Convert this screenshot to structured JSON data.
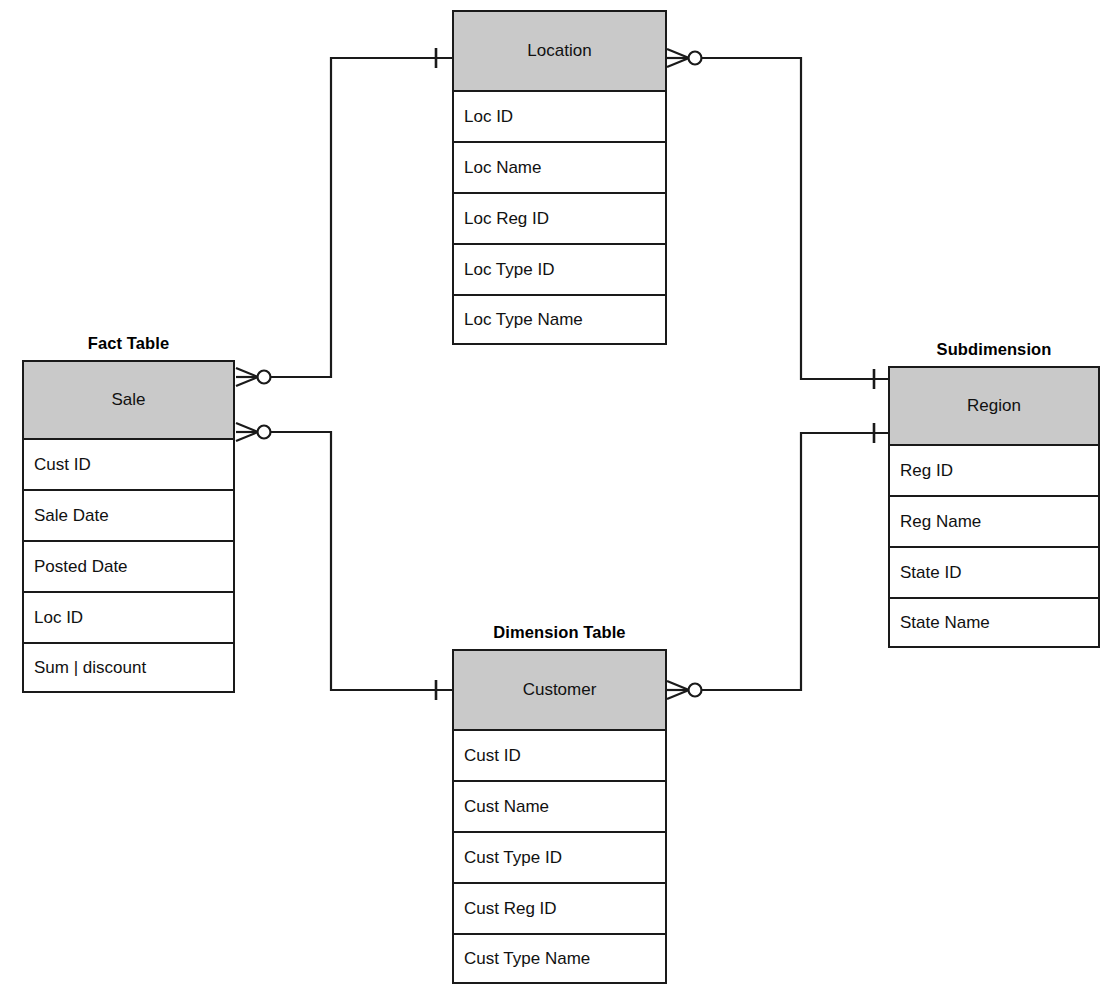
{
  "diagram": {
    "type": "entity-relationship",
    "notation": "crows-foot",
    "background_color": "#ffffff",
    "line_color": "#1a1a1a",
    "header_fill_color": "#c9c9c9"
  },
  "entities": [
    {
      "id": "sale",
      "role_label": "Fact Table",
      "name": "Sale",
      "attributes": [
        "Cust ID",
        "Sale Date",
        "Posted Date",
        "Loc ID",
        "Sum | discount"
      ]
    },
    {
      "id": "location",
      "role_label": "",
      "name": "Location",
      "attributes": [
        "Loc ID",
        "Loc Name",
        "Loc Reg ID",
        "Loc Type ID",
        "Loc Type Name"
      ]
    },
    {
      "id": "customer",
      "role_label": "Dimension Table",
      "name": "Customer",
      "attributes": [
        "Cust ID",
        "Cust Name",
        "Cust Type ID",
        "Cust Reg ID",
        "Cust Type Name"
      ]
    },
    {
      "id": "region",
      "role_label": "Subdimension",
      "name": "Region",
      "attributes": [
        "Reg ID",
        "Reg Name",
        "State ID",
        "State Name"
      ]
    }
  ],
  "relationships": [
    {
      "id": "sale-location",
      "from": "Sale",
      "to": "Location",
      "from_cardinality": "many-optional",
      "to_cardinality": "one"
    },
    {
      "id": "sale-customer",
      "from": "Sale",
      "to": "Customer",
      "from_cardinality": "many-optional",
      "to_cardinality": "one"
    },
    {
      "id": "location-region",
      "from": "Location",
      "to": "Region",
      "from_cardinality": "many-optional",
      "to_cardinality": "one"
    },
    {
      "id": "customer-region",
      "from": "Customer",
      "to": "Region",
      "from_cardinality": "many-optional",
      "to_cardinality": "one"
    }
  ]
}
